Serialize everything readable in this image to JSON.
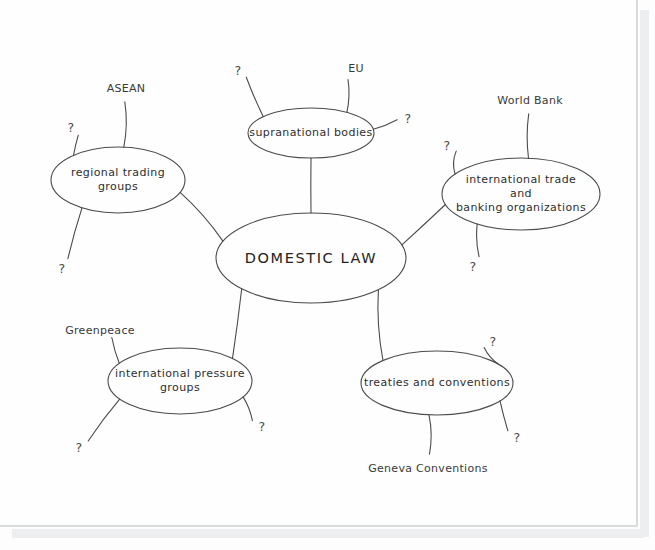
{
  "diagram": {
    "style": "hand-drawn",
    "stroke_color": "#4b4b4b",
    "text_color": "#2e2e2e",
    "background_color": "#fdfdfd",
    "central_node": {
      "label": "DOMESTIC LAW",
      "cx": 311,
      "cy": 258,
      "rx": 95,
      "ry": 45
    },
    "branches": [
      {
        "id": "regional-trading-groups",
        "label": "regional trading\ngroups",
        "cx": 118,
        "cy": 180,
        "rx": 67,
        "ry": 33,
        "leaves": [
          {
            "id": "asean",
            "label": "ASEAN",
            "x": 126,
            "y": 88
          },
          {
            "id": "q-rtg-left",
            "label": "?",
            "x": 71,
            "y": 127
          },
          {
            "id": "q-rtg-bottom",
            "label": "?",
            "x": 62,
            "y": 268
          }
        ]
      },
      {
        "id": "supranational-bodies",
        "label": "supranational bodies",
        "cx": 311,
        "cy": 133,
        "rx": 63,
        "ry": 25,
        "leaves": [
          {
            "id": "q-sb-left",
            "label": "?",
            "x": 238,
            "y": 70
          },
          {
            "id": "eu",
            "label": "EU",
            "x": 356,
            "y": 68
          },
          {
            "id": "q-sb-right",
            "label": "?",
            "x": 408,
            "y": 118
          }
        ]
      },
      {
        "id": "international-trade-banking",
        "label": "international trade and\nbanking organizations",
        "cx": 521,
        "cy": 194,
        "rx": 79,
        "ry": 36,
        "leaves": [
          {
            "id": "q-itb-left",
            "label": "?",
            "x": 447,
            "y": 145
          },
          {
            "id": "world-bank",
            "label": "World Bank",
            "x": 530,
            "y": 100
          },
          {
            "id": "q-itb-bottom",
            "label": "?",
            "x": 473,
            "y": 266
          }
        ]
      },
      {
        "id": "treaties-and-conventions",
        "label": "treaties and conventions",
        "cx": 437,
        "cy": 383,
        "rx": 76,
        "ry": 32,
        "leaves": [
          {
            "id": "q-tc-topright",
            "label": "?",
            "x": 493,
            "y": 341
          },
          {
            "id": "q-tc-right",
            "label": "?",
            "x": 517,
            "y": 437
          },
          {
            "id": "geneva-conventions",
            "label": "Geneva Conventions",
            "x": 428,
            "y": 468
          }
        ]
      },
      {
        "id": "international-pressure-groups",
        "label": "international pressure\ngroups",
        "cx": 180,
        "cy": 381,
        "rx": 72,
        "ry": 33,
        "leaves": [
          {
            "id": "greenpeace",
            "label": "Greenpeace",
            "x": 100,
            "y": 330
          },
          {
            "id": "q-ipg-bottomleft",
            "label": "?",
            "x": 79,
            "y": 447
          },
          {
            "id": "q-ipg-bottomright",
            "label": "?",
            "x": 262,
            "y": 426
          }
        ]
      }
    ]
  }
}
